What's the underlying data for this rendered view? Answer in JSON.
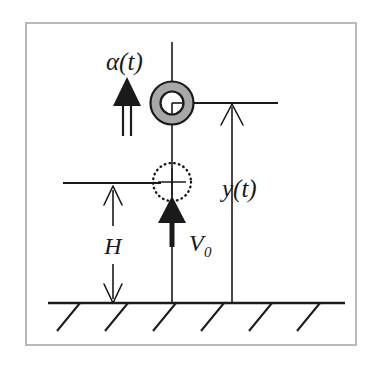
{
  "figure": {
    "kind": "physics-schematic",
    "background_color": "#ffffff",
    "frame": {
      "name": "figure-border",
      "color": "#b9b9b9",
      "x": 25,
      "y": 22,
      "width": 332,
      "height": 324,
      "stroke_width": 2
    },
    "labels": {
      "alpha": "α(t)",
      "y_of_t": "y(t)",
      "height": "H",
      "initial_velocity": "V",
      "initial_velocity_subscript": "0"
    },
    "elements": {
      "moving_body": {
        "name": "projectile-ring-current",
        "shape": "annulus-with-crosshair",
        "center_x": 172,
        "center_y": 103,
        "outer_radius": 22,
        "inner_radius": 12,
        "fill": "#a8a8a8",
        "stroke": "#1a1a1a"
      },
      "ghost_body": {
        "name": "projectile-ring-initial",
        "shape": "dotted-circle-with-crosshair",
        "center_x": 172,
        "center_y": 182,
        "radius": 19,
        "stroke": "#1a1a1a",
        "dash": "dotted"
      },
      "center_axis": {
        "name": "vertical-center-axis",
        "x": 172,
        "y_top": 42,
        "y_bottom": 303
      },
      "upper_level_line": {
        "name": "upper-reference-line",
        "y": 103,
        "x_start": 172,
        "x_end": 278
      },
      "lower_level_line": {
        "name": "lower-reference-line",
        "y": 183,
        "x_start": 63,
        "x_end": 161
      },
      "ground": {
        "name": "ground-line",
        "y": 303,
        "x_start": 48,
        "x_end": 345,
        "hatch_count": 6,
        "hatch_length": 30
      },
      "y_measure": {
        "name": "y-dimension-arrow",
        "x": 232,
        "y_tip": 105,
        "y_base": 303
      },
      "h_measure": {
        "name": "h-dimension-arrows",
        "x": 113,
        "upper_tip_y": 187,
        "upper_base_y": 226,
        "lower_base_y": 264,
        "lower_tip_y": 302
      },
      "alpha_arrow": {
        "name": "acceleration-double-arrow",
        "x": 127,
        "y_tip": 79,
        "y_base": 136,
        "style": "double-shaft-solid-head"
      },
      "v0_arrow": {
        "name": "initial-velocity-arrow",
        "x": 172,
        "y_tip": 197,
        "y_base": 245,
        "style": "thick-shaft-solid-head"
      }
    },
    "colors": {
      "ink": "#1a1a1a",
      "ring_fill": "#a8a8a8",
      "frame": "#b9b9b9"
    }
  }
}
